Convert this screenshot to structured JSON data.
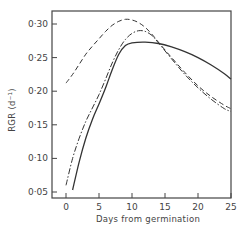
{
  "chart_data": {
    "type": "line",
    "title": "",
    "xlabel": "Days from germination",
    "ylabel": "RGR (d⁻¹)",
    "xlim": [
      -2,
      25
    ],
    "ylim": [
      0.04,
      0.32
    ],
    "x_ticks": [
      0,
      5,
      10,
      15,
      20,
      25
    ],
    "x_tick_labels": [
      "0",
      "5",
      "10",
      "15",
      "20",
      "25"
    ],
    "y_ticks": [
      0.05,
      0.1,
      0.15,
      0.2,
      0.25,
      0.3
    ],
    "y_tick_labels": [
      "0·05",
      "0·10",
      "0·15",
      "0·20",
      "0·25",
      "0·30"
    ],
    "grid": false,
    "legend": "none",
    "series": [
      {
        "name": "solid",
        "style": "solid",
        "x": [
          1,
          2,
          3,
          4,
          5,
          6,
          7,
          8,
          9,
          10,
          12,
          14,
          16,
          18,
          20,
          22,
          24,
          25
        ],
        "values": [
          0.053,
          0.095,
          0.13,
          0.158,
          0.181,
          0.205,
          0.232,
          0.255,
          0.268,
          0.272,
          0.273,
          0.271,
          0.266,
          0.259,
          0.25,
          0.239,
          0.226,
          0.218
        ]
      },
      {
        "name": "dash-dot",
        "style": "dashdot",
        "x": [
          0,
          1,
          2,
          3,
          4,
          5,
          6,
          7,
          8,
          9,
          10,
          11,
          12,
          13,
          14,
          16,
          18,
          20,
          22,
          24,
          25
        ],
        "values": [
          0.06,
          0.1,
          0.13,
          0.155,
          0.175,
          0.195,
          0.218,
          0.242,
          0.262,
          0.277,
          0.286,
          0.29,
          0.289,
          0.283,
          0.272,
          0.248,
          0.225,
          0.205,
          0.188,
          0.174,
          0.17
        ]
      },
      {
        "name": "dashed",
        "style": "dashed",
        "x": [
          0,
          1,
          2,
          3,
          4,
          5,
          6,
          7,
          8,
          9,
          10,
          11,
          12,
          13,
          14,
          16,
          18,
          20,
          22,
          24,
          25
        ],
        "values": [
          0.212,
          0.225,
          0.24,
          0.255,
          0.267,
          0.278,
          0.289,
          0.298,
          0.304,
          0.307,
          0.306,
          0.302,
          0.295,
          0.285,
          0.273,
          0.25,
          0.228,
          0.208,
          0.192,
          0.179,
          0.174
        ]
      }
    ]
  }
}
